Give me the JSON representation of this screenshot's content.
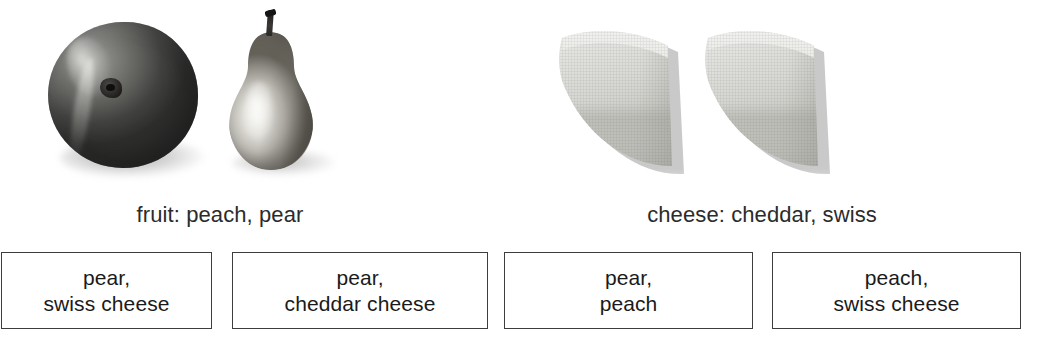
{
  "figure": {
    "title": "",
    "categories": [
      {
        "id": "fruit",
        "caption": "fruit: peach, pear",
        "items": [
          {
            "name": "peach",
            "icon": "peach-photo"
          },
          {
            "name": "pear",
            "icon": "pear-photo"
          }
        ]
      },
      {
        "id": "cheese",
        "caption": "cheese: cheddar, swiss",
        "items": [
          {
            "name": "cheddar",
            "icon": "cheese-wedge-photo"
          },
          {
            "name": "swiss",
            "icon": "cheese-wedge-photo"
          }
        ]
      }
    ]
  },
  "options": [
    {
      "id": "option-1",
      "line1": "pear,",
      "line2": "swiss cheese",
      "text": "pear,\nswiss cheese"
    },
    {
      "id": "option-2",
      "line1": "pear,",
      "line2": "cheddar cheese",
      "text": "pear,\ncheddar cheese"
    },
    {
      "id": "option-3",
      "line1": "pear,",
      "line2": "peach",
      "text": "pear,\npeach"
    },
    {
      "id": "option-4",
      "line1": "peach,",
      "line2": "swiss cheese",
      "text": "peach,\nswiss cheese"
    }
  ],
  "colors": {
    "background": "#ffffff",
    "box_border": "#3d3d3d",
    "caption_text": "#2b2b2b",
    "option_text": "#1a1a1a"
  }
}
